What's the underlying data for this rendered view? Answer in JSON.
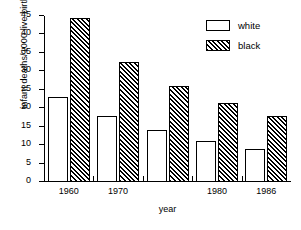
{
  "chart_data": {
    "type": "bar",
    "title": "",
    "xlabel": "year",
    "ylabel": "infant deaths/1000 live births",
    "categories": [
      "1960",
      "1970",
      "",
      "1980",
      "1986"
    ],
    "xtick_labels": [
      "1960",
      "1970",
      "1980",
      "1986"
    ],
    "ytick_labels": [
      "0",
      "5",
      "10",
      "15",
      "20",
      "25",
      "30",
      "35",
      "40",
      "45"
    ],
    "ylim": [
      0,
      45
    ],
    "yticks": [
      0,
      5,
      10,
      15,
      20,
      25,
      30,
      35,
      40,
      45
    ],
    "grid": false,
    "legend_position": "top-right",
    "series": [
      {
        "name": "white",
        "fill": "empty",
        "values": [
          23,
          18,
          14,
          11,
          9
        ]
      },
      {
        "name": "black",
        "fill": "hatched",
        "values": [
          44.5,
          32.5,
          26,
          21.5,
          18
        ]
      }
    ]
  },
  "legend": {
    "entries": [
      {
        "label": "white",
        "swatch": "white-box-swatch"
      },
      {
        "label": "black",
        "swatch": "hatched-box-swatch"
      }
    ]
  }
}
